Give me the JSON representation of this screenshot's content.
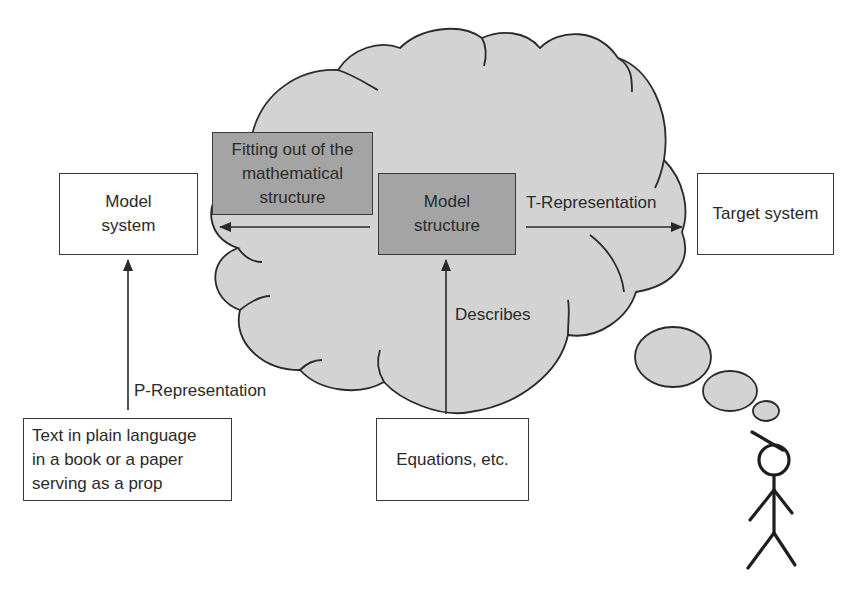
{
  "diagram": {
    "type": "conceptual-flow-diagram",
    "colors": {
      "cloud_fill": "#d3d3d3",
      "cloud_stroke": "#2a2a2a",
      "dark_box_fill": "#a4a4a4",
      "white_box_fill": "#ffffff",
      "line": "#2a2a2a"
    },
    "boxes": {
      "model_system": {
        "label": "Model\nsystem"
      },
      "fitting_out": {
        "label": "Fitting out of the\nmathematical\nstructure"
      },
      "model_structure": {
        "label": "Model\nstructure"
      },
      "target_system": {
        "label": "Target system"
      },
      "text_prop": {
        "label": "Text in plain language\nin a book or a paper\nserving as a prop"
      },
      "equations": {
        "label": "Equations, etc."
      }
    },
    "arrows": {
      "t_representation": {
        "label": "T-Representation",
        "from": "Model structure",
        "to": "Target system"
      },
      "p_representation": {
        "label": "P-Representation",
        "from": "Text in plain language in a book or a paper serving as a prop",
        "to": "Model system"
      },
      "describes": {
        "label": "Describes",
        "from": "Equations, etc.",
        "to": "Model structure"
      },
      "fitting_arrow": {
        "label": "",
        "from": "Model structure",
        "to": "Model system"
      }
    },
    "figures": {
      "thinker": {
        "icon": "stick-figure-icon",
        "thought_bubbles": 3
      }
    }
  }
}
